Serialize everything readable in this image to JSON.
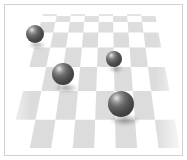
{
  "scene": {
    "title": "Checkerboard Plane with Spheres",
    "background_color": "#ffffff",
    "border_color": "#d2d2d2",
    "floor": {
      "type": "perspective-checkerboard",
      "light_tile_color": "#fbfbfb",
      "dark_tile_color": "#dcdcdc",
      "columns": 8,
      "rows": 8,
      "horizon_y": 9,
      "near_y": 148,
      "horizon_left_x": 38,
      "horizon_right_x": 150,
      "near_left_x": 2,
      "near_right_x": 176
    },
    "spheres": [
      {
        "id": "sphere-top-left",
        "label": "Small sphere, upper left",
        "cx": 30,
        "cy": 29,
        "radius": 9,
        "base_color": "#4a4a4a",
        "highlight_color": "#e8e8e8"
      },
      {
        "id": "sphere-mid-left",
        "label": "Medium sphere, middle left",
        "cx": 58,
        "cy": 69,
        "radius": 11,
        "base_color": "#4a4a4a",
        "highlight_color": "#e8e8e8"
      },
      {
        "id": "sphere-mid-right",
        "label": "Small sphere, middle right",
        "cx": 109,
        "cy": 54,
        "radius": 8,
        "base_color": "#4a4a4a",
        "highlight_color": "#e8e8e8"
      },
      {
        "id": "sphere-bottom-right",
        "label": "Large sphere, lower right",
        "cx": 116,
        "cy": 99,
        "radius": 13,
        "base_color": "#4a4a4a",
        "highlight_color": "#e8e8e8"
      }
    ],
    "shadows": [
      {
        "id": "shadow-top-left",
        "cx": 32,
        "cy": 40,
        "rx": 8,
        "ry": 3
      },
      {
        "id": "shadow-mid-left",
        "cx": 61,
        "cy": 83,
        "rx": 11,
        "ry": 4
      },
      {
        "id": "shadow-mid-right",
        "cx": 111,
        "cy": 64,
        "rx": 7,
        "ry": 3
      },
      {
        "id": "shadow-bottom-right",
        "cx": 120,
        "cy": 115,
        "rx": 14,
        "ry": 5
      }
    ]
  }
}
